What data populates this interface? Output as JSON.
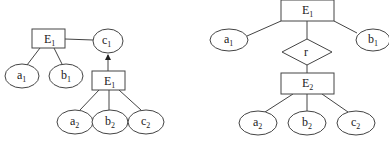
{
  "diagrams": [
    {
      "id": "left",
      "entities": [
        {
          "id": "E1_top",
          "label": "E",
          "sub": "1"
        },
        {
          "id": "E1_bottom",
          "label": "E",
          "sub": "1"
        }
      ],
      "attributes": [
        {
          "id": "c1",
          "label": "c",
          "sub": "1"
        },
        {
          "id": "a1",
          "label": "a",
          "sub": "1"
        },
        {
          "id": "b1",
          "label": "b",
          "sub": "1"
        },
        {
          "id": "a2",
          "label": "a",
          "sub": "2"
        },
        {
          "id": "b2",
          "label": "b",
          "sub": "2"
        },
        {
          "id": "c2",
          "label": "c",
          "sub": "2"
        }
      ],
      "edges": [
        {
          "from": "E1_top",
          "to": "c1",
          "type": "line"
        },
        {
          "from": "E1_top",
          "to": "a1",
          "type": "line"
        },
        {
          "from": "E1_top",
          "to": "b1",
          "type": "line"
        },
        {
          "from": "E1_bottom",
          "to": "c1",
          "type": "arrow"
        },
        {
          "from": "E1_bottom",
          "to": "a2",
          "type": "line"
        },
        {
          "from": "E1_bottom",
          "to": "b2",
          "type": "line"
        },
        {
          "from": "E1_bottom",
          "to": "c2",
          "type": "line"
        }
      ]
    },
    {
      "id": "right",
      "entities": [
        {
          "id": "E1",
          "label": "E",
          "sub": "1"
        },
        {
          "id": "E2",
          "label": "E",
          "sub": "2"
        }
      ],
      "relationships": [
        {
          "id": "r",
          "label": "r"
        }
      ],
      "attributes": [
        {
          "id": "a1",
          "label": "a",
          "sub": "1"
        },
        {
          "id": "b1",
          "label": "b",
          "sub": "1"
        },
        {
          "id": "a2",
          "label": "a",
          "sub": "2"
        },
        {
          "id": "b2",
          "label": "b",
          "sub": "2"
        },
        {
          "id": "c2",
          "label": "c",
          "sub": "2"
        }
      ],
      "edges": [
        {
          "from": "E1",
          "to": "a1",
          "type": "line"
        },
        {
          "from": "E1",
          "to": "b1",
          "type": "line"
        },
        {
          "from": "E1",
          "to": "r",
          "type": "line"
        },
        {
          "from": "r",
          "to": "E2",
          "type": "line"
        },
        {
          "from": "E2",
          "to": "a2",
          "type": "line"
        },
        {
          "from": "E2",
          "to": "b2",
          "type": "line"
        },
        {
          "from": "E2",
          "to": "c2",
          "type": "line"
        }
      ]
    }
  ],
  "colors": {
    "stroke": "#444444",
    "text": "#222222",
    "background": "#ffffff"
  }
}
